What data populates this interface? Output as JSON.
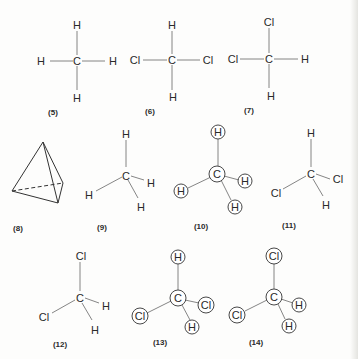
{
  "figure": {
    "structures": [
      {
        "label": "(5)",
        "center": "C",
        "substituents": [
          "H",
          "H",
          "H",
          "H"
        ],
        "style": "planar"
      },
      {
        "label": "(6)",
        "center": "C",
        "substituents": [
          "H",
          "Cl",
          "Cl",
          "H"
        ],
        "style": "planar"
      },
      {
        "label": "(7)",
        "center": "C",
        "substituents": [
          "Cl",
          "Cl",
          "H",
          "H"
        ],
        "style": "planar"
      },
      {
        "label": "(8)",
        "center": "",
        "substituents": [],
        "style": "tetrahedron"
      },
      {
        "label": "(9)",
        "center": "C",
        "substituents": [
          "H",
          "H",
          "H",
          "H"
        ],
        "style": "perspective"
      },
      {
        "label": "(10)",
        "center": "C",
        "substituents": [
          "H",
          "H",
          "H",
          "H"
        ],
        "style": "perspective-circled"
      },
      {
        "label": "(11)",
        "center": "C",
        "substituents": [
          "H",
          "Cl",
          "Cl",
          "H"
        ],
        "style": "perspective"
      },
      {
        "label": "(12)",
        "center": "C",
        "substituents": [
          "Cl",
          "Cl",
          "H",
          "H"
        ],
        "style": "perspective"
      },
      {
        "label": "(13)",
        "center": "C",
        "substituents": [
          "H",
          "Cl",
          "Cl",
          "H"
        ],
        "style": "perspective-circled"
      },
      {
        "label": "(14)",
        "center": "C",
        "substituents": [
          "Cl",
          "Cl",
          "H",
          "H"
        ],
        "style": "perspective-circled"
      }
    ]
  }
}
